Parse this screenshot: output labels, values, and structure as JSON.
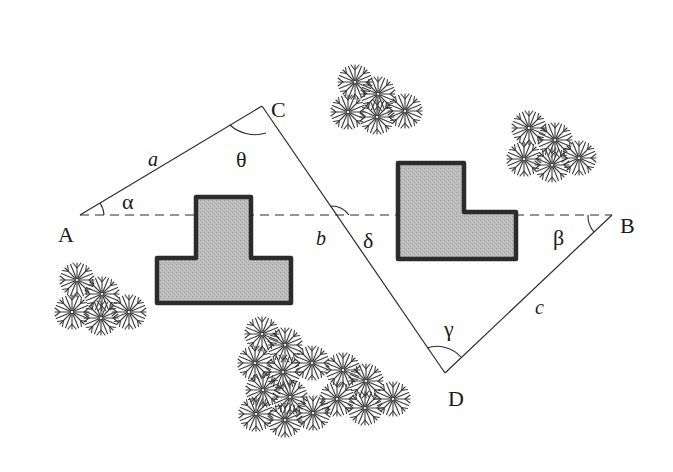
{
  "diagram": {
    "type": "surveying-triangle-figure",
    "colors": {
      "line": "#2a2a2a",
      "building_fill": "#b9b9b9",
      "building_stroke": "#2b2b2b",
      "tree": "#3a3a3a",
      "background": "#ffffff"
    },
    "points": {
      "A": {
        "label": "A",
        "x": 80,
        "y": 215
      },
      "B": {
        "label": "B",
        "x": 612,
        "y": 215
      },
      "C": {
        "label": "C",
        "x": 262,
        "y": 106
      },
      "D": {
        "label": "D",
        "x": 445,
        "y": 373
      }
    },
    "sides": {
      "a": {
        "label": "a",
        "from": "A",
        "to": "C"
      },
      "b": {
        "label": "b",
        "from": "C",
        "to": "D"
      },
      "c": {
        "label": "c",
        "from": "D",
        "to": "B"
      },
      "baseline": {
        "from": "A",
        "to": "B",
        "style": "dashed"
      }
    },
    "angles": {
      "alpha": {
        "label": "α",
        "vertex": "A"
      },
      "theta": {
        "label": "θ",
        "vertex": "C"
      },
      "delta": {
        "label": "δ",
        "vertex": "intersection of CD and AB"
      },
      "beta": {
        "label": "β",
        "vertex": "B"
      },
      "gamma": {
        "label": "γ",
        "vertex": "D"
      }
    },
    "obstacles": [
      {
        "name": "t-shaped-building",
        "shape": "T"
      },
      {
        "name": "l-shaped-building",
        "shape": "L"
      },
      {
        "name": "tree-cluster-top-center",
        "count": 5
      },
      {
        "name": "tree-cluster-top-right",
        "count": 5
      },
      {
        "name": "tree-cluster-left",
        "count": 5
      },
      {
        "name": "tree-cluster-bottom",
        "count": 14
      }
    ]
  }
}
